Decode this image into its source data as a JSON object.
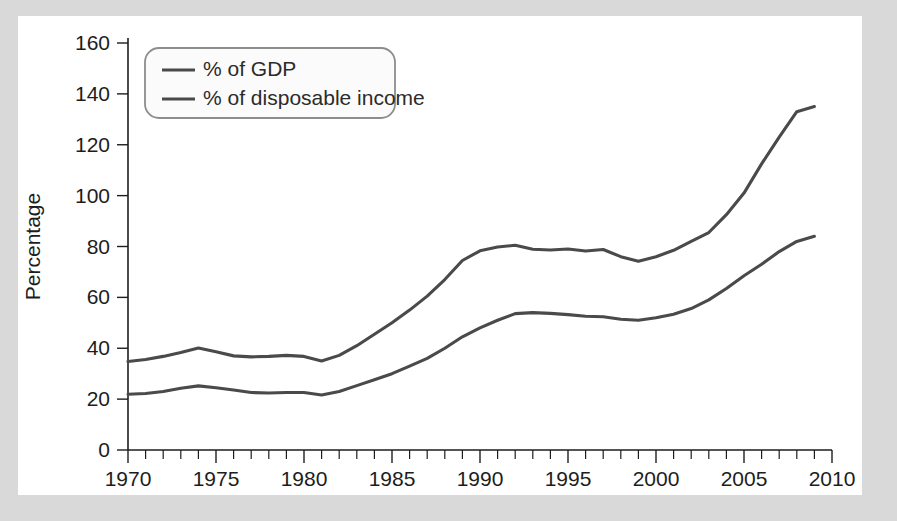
{
  "chart_data": {
    "type": "line",
    "title": "",
    "xlabel": "",
    "ylabel": "Percentage",
    "xlim": [
      1970,
      2010
    ],
    "ylim": [
      0,
      160
    ],
    "ytick_step": 20,
    "xtick_step": 5,
    "xminor_step": 1,
    "grid": false,
    "legend_position": "top-left",
    "yticks": [
      "0",
      "20",
      "40",
      "60",
      "80",
      "100",
      "120",
      "140",
      "160"
    ],
    "xticks": [
      "1970",
      "1975",
      "1980",
      "1985",
      "1990",
      "1995",
      "2000",
      "2005",
      "2010"
    ],
    "line_color": "#4a4a4a",
    "x": [
      1970,
      1971,
      1972,
      1973,
      1974,
      1975,
      1976,
      1977,
      1978,
      1979,
      1980,
      1981,
      1982,
      1983,
      1984,
      1985,
      1986,
      1987,
      1988,
      1989,
      1990,
      1991,
      1992,
      1993,
      1994,
      1995,
      1996,
      1997,
      1998,
      1999,
      2000,
      2001,
      2002,
      2003,
      2004,
      2005,
      2006,
      2007,
      2008,
      2009
    ],
    "series": [
      {
        "name": "% of GDP",
        "values": [
          34.8,
          35.6,
          36.8,
          38.3,
          40.1,
          38.6,
          37.0,
          36.6,
          36.8,
          37.2,
          36.8,
          35.0,
          37.2,
          41.0,
          45.5,
          50.0,
          55.0,
          60.5,
          67.0,
          74.5,
          78.3,
          79.8,
          80.5,
          78.9,
          78.6,
          79.0,
          78.2,
          78.8,
          76.0,
          74.2,
          76.0,
          78.5,
          82.0,
          85.5,
          92.5,
          101.0,
          112.5,
          123.0,
          133.0,
          135.0
        ]
      },
      {
        "name": "% of disposable income",
        "values": [
          21.9,
          22.2,
          23.0,
          24.3,
          25.2,
          24.5,
          23.6,
          22.6,
          22.4,
          22.6,
          22.6,
          21.6,
          23.0,
          25.3,
          27.6,
          30.0,
          33.0,
          36.0,
          40.0,
          44.5,
          48.0,
          51.0,
          53.6,
          54.0,
          53.7,
          53.2,
          52.6,
          52.4,
          51.4,
          51.0,
          52.0,
          53.4,
          55.6,
          59.0,
          63.5,
          68.5,
          73.0,
          78.0,
          82.0,
          84.0
        ]
      }
    ]
  },
  "legend": {
    "entries": [
      {
        "label": "% of GDP"
      },
      {
        "label": "% of disposable income"
      }
    ]
  }
}
